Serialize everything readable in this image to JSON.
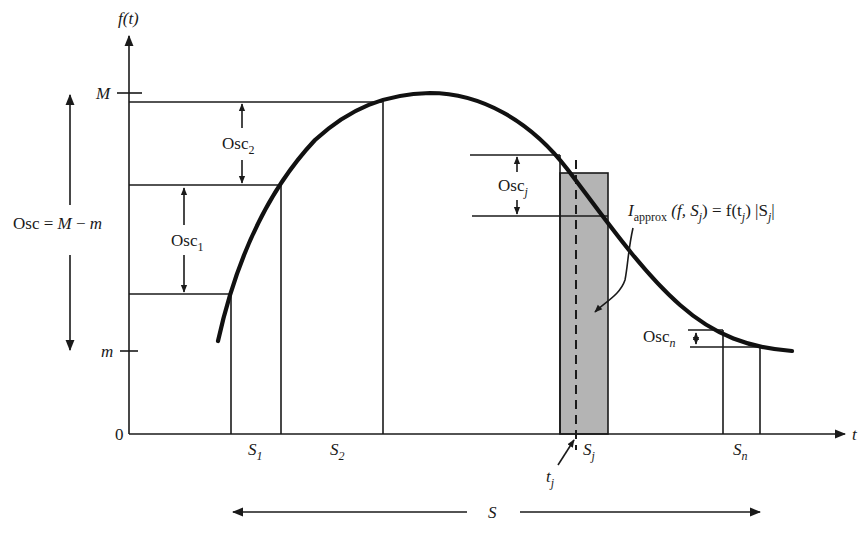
{
  "diagram": {
    "y_axis_label": "f(t)",
    "x_axis_label": "t",
    "origin_label": "0",
    "M_label": "M",
    "m_label": "m",
    "osc_total": {
      "prefix": "Osc = ",
      "M": "M",
      "minus": " − ",
      "m": "m"
    },
    "osc_1": {
      "base": "Osc",
      "sub": "1"
    },
    "osc_2": {
      "base": "Osc",
      "sub": "2"
    },
    "osc_j": {
      "base": "Osc",
      "sub": "j"
    },
    "osc_n": {
      "base": "Osc",
      "sub": "n"
    },
    "intervals": [
      {
        "base": "S",
        "sub": "1"
      },
      {
        "base": "S",
        "sub": "2"
      },
      {
        "base": "S",
        "sub": "j"
      },
      {
        "base": "S",
        "sub": "n"
      }
    ],
    "tj_label": {
      "base": "t",
      "sub": "j"
    },
    "S_label": "S",
    "iapprox": {
      "I": "I",
      "sub": "approx",
      "args_open": " (f, ",
      "Sj": "S",
      "Sj_sub": "j",
      "eq": ") = f(t",
      "tj_sub": "j",
      "tail": ") |S",
      "tail_sub": "j",
      "close": "|"
    },
    "colors": {
      "ink": "#1a1a1a",
      "shaded_rect": "#b4b4b4",
      "background": "#ffffff"
    }
  }
}
